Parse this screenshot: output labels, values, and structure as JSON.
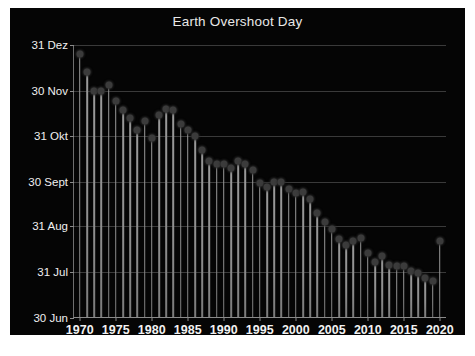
{
  "figure": {
    "background_color": "#050505",
    "page_background_color": "#ffffff",
    "title": "Earth Overshoot Day"
  },
  "chart_data": {
    "type": "bar",
    "title": "Earth Overshoot Day",
    "xlabel": "",
    "ylabel": "",
    "grid": true,
    "legend": null,
    "style": "stem / lollipop chart (thin vertical lines with round markers)",
    "marker_color": "#3b3b3b",
    "stem_color": "#8f8f8f",
    "gridline_color": "#3a3a3a",
    "axis_color": "#8a8a8a",
    "tick_label_color": "#f0f0f0",
    "xlim": [
      1969.2,
      2021.0
    ],
    "ylim_labels": [
      "30 Jun",
      "31 Dez"
    ],
    "ytick_labels": [
      "31 Dez",
      "30 Nov",
      "31 Okt",
      "30 Sept",
      "31 Aug",
      "31 Jul",
      "30 Jun"
    ],
    "ytick_values": [
      365,
      334,
      304,
      273,
      243,
      212,
      181
    ],
    "xtick_labels": [
      "1970",
      "1975",
      "1980",
      "1985",
      "1990",
      "1995",
      "2000",
      "2005",
      "2010",
      "2015",
      "2020"
    ],
    "xtick_values": [
      1970,
      1975,
      1980,
      1985,
      1990,
      1995,
      2000,
      2005,
      2010,
      2015,
      2020
    ],
    "x_axis_note": "Year of Earth Overshoot Day",
    "y_axis_note": "Date of Earth Overshoot Day (day of year); higher = later in the year",
    "categories": [
      1970,
      1971,
      1972,
      1973,
      1974,
      1975,
      1976,
      1977,
      1978,
      1979,
      1980,
      1981,
      1982,
      1983,
      1984,
      1985,
      1986,
      1987,
      1988,
      1989,
      1990,
      1991,
      1992,
      1993,
      1994,
      1995,
      1996,
      1997,
      1998,
      1999,
      2000,
      2001,
      2002,
      2003,
      2004,
      2005,
      2006,
      2007,
      2008,
      2009,
      2010,
      2011,
      2012,
      2013,
      2014,
      2015,
      2016,
      2017,
      2018,
      2019,
      2020
    ],
    "values": [
      359,
      347,
      334,
      334,
      338,
      327,
      321,
      316,
      308,
      314,
      302,
      318,
      322,
      321,
      312,
      308,
      304,
      294,
      287,
      285,
      285,
      282,
      287,
      285,
      281,
      272,
      269,
      273,
      273,
      268,
      265,
      266,
      261,
      252,
      246,
      241,
      234,
      230,
      233,
      235,
      225,
      219,
      223,
      217,
      216,
      216,
      213,
      211,
      208,
      206,
      233
    ],
    "value_labels": [
      "29 Dez",
      "17 Dez",
      "4 Dez",
      "4 Dez",
      "8 Dez",
      "27 Nov",
      "21 Nov",
      "16 Nov",
      "8 Nov",
      "14 Nov",
      "2 Nov",
      "18 Nov",
      "22 Nov",
      "21 Nov",
      "12 Nov",
      "8 Nov",
      "4 Nov",
      "25 Okt",
      "18 Okt",
      "16 Okt",
      "16 Okt",
      "13 Okt",
      "18 Okt",
      "16 Okt",
      "12 Okt",
      "3 Okt",
      "30 Sept",
      "4 Okt",
      "4 Okt",
      "29 Sept",
      "26 Sept",
      "27 Sept",
      "22 Sept",
      "13 Sept",
      "6 Sept",
      "1 Sept",
      "25 Aug",
      "21 Aug",
      "24 Aug",
      "26 Aug",
      "16 Aug",
      "10 Aug",
      "14 Aug",
      "8 Aug",
      "7 Aug",
      "7 Aug",
      "4 Aug",
      "2 Aug",
      "30 Jul",
      "28 Jul",
      "24 Aug"
    ],
    "notable": "The final year (2020) rises sharply relative to the preceding downward trend."
  }
}
